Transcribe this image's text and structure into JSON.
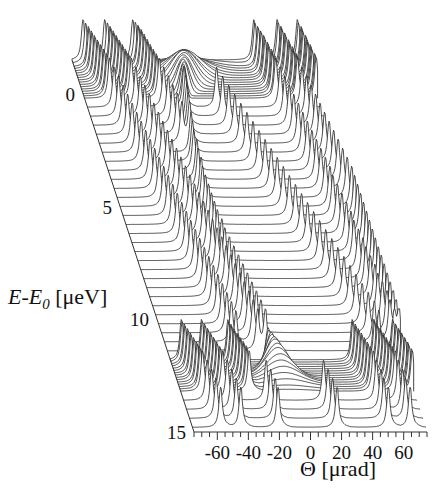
{
  "chart_data": {
    "type": "line",
    "subtype": "waterfall-3d",
    "title": "",
    "xlabel": "Θ [μrad]",
    "ylabel_prefix_italic": "E-E",
    "ylabel_subscript": "0",
    "ylabel_suffix": " [μeV]",
    "xlim": [
      -75,
      75
    ],
    "ylim": [
      -1.5,
      15
    ],
    "x_ticks": [
      -60,
      -40,
      -20,
      0,
      20,
      40,
      60
    ],
    "x_tick_labels": [
      "-60",
      "-40",
      "-20",
      "0",
      "20",
      "40",
      "60"
    ],
    "x_minor_step": 5,
    "y_ticks": [
      0,
      5,
      10,
      15
    ],
    "y_tick_labels": [
      "0",
      "5",
      "10",
      "15"
    ],
    "grid": false,
    "legend": "none",
    "series_model": {
      "description": "Each trace is reflectivity vs Θ at a fixed energy E; sharp peaks at Θ positions listed per trace, plus a broad central bump near resonance energies",
      "dense_energy_bands": [
        [
          -1.5,
          0.2
        ],
        [
          11.8,
          13.2
        ]
      ]
    },
    "traces": [
      {
        "E": -1.5,
        "peaks": [
          -68,
          -54,
          -36,
          42,
          57,
          70
        ],
        "bump": -2,
        "bump_width": 0,
        "bump_height": 0.05
      },
      {
        "E": -1.35,
        "peaks": [
          -67,
          -53,
          -35,
          42,
          57,
          70
        ],
        "bump": -3,
        "bump_width": 16,
        "bump_height": 0.15
      },
      {
        "E": -1.2,
        "peaks": [
          -66,
          -52,
          -34,
          43,
          58,
          71
        ],
        "bump": -4,
        "bump_width": 15,
        "bump_height": 0.25
      },
      {
        "E": -1.1,
        "peaks": [
          -66,
          -52,
          -34,
          43,
          58,
          71
        ],
        "bump": -5,
        "bump_width": 14,
        "bump_height": 0.35
      },
      {
        "E": -1.0,
        "peaks": [
          -65,
          -51,
          -33,
          44,
          58,
          71
        ],
        "bump": -5,
        "bump_width": 13,
        "bump_height": 0.45
      },
      {
        "E": -0.9,
        "peaks": [
          -65,
          -51,
          -33,
          44,
          59,
          71
        ],
        "bump": -6,
        "bump_width": 12,
        "bump_height": 0.55
      },
      {
        "E": -0.8,
        "peaks": [
          -64,
          -50,
          -32,
          45,
          59,
          72
        ],
        "bump": -6,
        "bump_width": 11,
        "bump_height": 0.65
      },
      {
        "E": -0.7,
        "peaks": [
          -64,
          -50,
          -32,
          45,
          59,
          72
        ],
        "bump": -7,
        "bump_width": 10,
        "bump_height": 0.7
      },
      {
        "E": -0.6,
        "peaks": [
          -63,
          -49,
          -31,
          45,
          60,
          72
        ],
        "bump": -7,
        "bump_width": 9,
        "bump_height": 0.75
      },
      {
        "E": -0.5,
        "peaks": [
          -63,
          -49,
          -31,
          46,
          60,
          72
        ],
        "bump": -8,
        "bump_width": 8,
        "bump_height": 0.8
      },
      {
        "E": -0.4,
        "peaks": [
          -62,
          -48,
          -30,
          46,
          60,
          73
        ],
        "bump": -8,
        "bump_width": 7,
        "bump_height": 0.8
      },
      {
        "E": -0.3,
        "peaks": [
          -62,
          -48,
          -30,
          46,
          61,
          73
        ],
        "bump": -9,
        "bump_width": 6,
        "bump_height": 0.8
      },
      {
        "E": -0.2,
        "peaks": [
          -61,
          -47,
          -29,
          47,
          61,
          73
        ],
        "bump": -9,
        "bump_width": 5,
        "bump_height": 0.8
      },
      {
        "E": -0.1,
        "peaks": [
          -61,
          -47,
          -29,
          47,
          61,
          73
        ],
        "bump": -10,
        "bump_width": 4,
        "bump_height": 0.8
      },
      {
        "E": 0.0,
        "peaks": [
          -60,
          -46,
          -28,
          47,
          62,
          74
        ],
        "bump": -10,
        "bump_width": 3,
        "bump_height": 0.8
      },
      {
        "E": 0.1,
        "peaks": [
          -60,
          -46,
          -28,
          48,
          62,
          74
        ],
        "bump": -11,
        "bump_width": 2,
        "bump_height": 0.8
      },
      {
        "E": 0.2,
        "peaks": [
          -59,
          -45,
          -27,
          48,
          62,
          74
        ],
        "bump": -11,
        "bump_width": 1.5,
        "bump_height": 0.8
      },
      {
        "E": 0.6,
        "peaks": [
          -58,
          -44,
          -26,
          -13,
          8,
          49,
          63
        ],
        "bump": 0,
        "bump_width": 0,
        "bump_height": 0
      },
      {
        "E": 1.0,
        "peaks": [
          -57,
          -43,
          -25,
          -14,
          10,
          50,
          64
        ],
        "bump": 0,
        "bump_width": 0,
        "bump_height": 0
      },
      {
        "E": 1.4,
        "peaks": [
          -56,
          -42,
          -24,
          -15,
          12,
          51,
          65
        ],
        "bump": 0,
        "bump_width": 0,
        "bump_height": 0
      },
      {
        "E": 1.8,
        "peaks": [
          -55,
          -41,
          -23,
          -16,
          14,
          52,
          66
        ],
        "bump": 0,
        "bump_width": 0,
        "bump_height": 0
      },
      {
        "E": 2.2,
        "peaks": [
          -54,
          -40,
          -22,
          -17,
          16,
          53,
          67
        ],
        "bump": 0,
        "bump_width": 0,
        "bump_height": 0
      },
      {
        "E": 2.6,
        "peaks": [
          -53,
          -39,
          -18,
          18,
          54,
          68
        ],
        "bump": 0,
        "bump_width": 0,
        "bump_height": 0
      },
      {
        "E": 3.0,
        "peaks": [
          -52,
          -38,
          -19,
          20,
          55,
          69
        ],
        "bump": 0,
        "bump_width": 0,
        "bump_height": 0
      },
      {
        "E": 3.4,
        "peaks": [
          -51,
          -37,
          -20,
          22,
          56,
          70
        ],
        "bump": 0,
        "bump_width": 0,
        "bump_height": 0
      },
      {
        "E": 3.8,
        "peaks": [
          -50,
          -36,
          -20,
          24,
          57,
          71
        ],
        "bump": 0,
        "bump_width": 0,
        "bump_height": 0
      },
      {
        "E": 4.2,
        "peaks": [
          -49,
          -35,
          -21,
          26,
          58,
          72
        ],
        "bump": 0,
        "bump_width": 0,
        "bump_height": 0
      },
      {
        "E": 4.6,
        "peaks": [
          -48,
          -34,
          -21,
          28,
          59,
          73
        ],
        "bump": 0,
        "bump_width": 0,
        "bump_height": 0
      },
      {
        "E": 5.0,
        "peaks": [
          -47,
          -33,
          -22,
          30,
          60,
          74
        ],
        "bump": 0,
        "bump_width": 0,
        "bump_height": 0
      },
      {
        "E": 5.4,
        "peaks": [
          -46,
          -32,
          -22,
          32,
          60,
          74
        ],
        "bump": 0,
        "bump_width": 0,
        "bump_height": 0
      },
      {
        "E": 5.8,
        "peaks": [
          -45,
          -31,
          -22,
          34,
          61,
          74
        ],
        "bump": 0,
        "bump_width": 0,
        "bump_height": 0
      },
      {
        "E": 6.2,
        "peaks": [
          -44,
          -30,
          -22,
          36,
          62,
          74
        ],
        "bump": 0,
        "bump_width": 0,
        "bump_height": 0
      },
      {
        "E": 6.6,
        "peaks": [
          -43,
          -29,
          -22,
          38,
          63,
          74
        ],
        "bump": 0,
        "bump_width": 0,
        "bump_height": 0
      },
      {
        "E": 7.0,
        "peaks": [
          -42,
          -28,
          -22,
          40,
          64,
          74
        ],
        "bump": 0,
        "bump_width": 0,
        "bump_height": 0
      },
      {
        "E": 7.4,
        "peaks": [
          -41,
          -27,
          -21,
          42,
          64,
          74
        ],
        "bump": 0,
        "bump_width": 0,
        "bump_height": 0
      },
      {
        "E": 7.8,
        "peaks": [
          -40,
          -26,
          -21,
          44,
          65,
          74
        ],
        "bump": 0,
        "bump_width": 0,
        "bump_height": 0
      },
      {
        "E": 8.2,
        "peaks": [
          -39,
          -25,
          -20,
          46,
          66,
          74
        ],
        "bump": 0,
        "bump_width": 0,
        "bump_height": 0
      },
      {
        "E": 8.6,
        "peaks": [
          -38,
          -24,
          -19,
          48,
          66,
          74
        ],
        "bump": 0,
        "bump_width": 0,
        "bump_height": 0
      },
      {
        "E": 9.0,
        "peaks": [
          -37,
          -23,
          -18,
          50,
          67,
          74
        ],
        "bump": 0,
        "bump_width": 0,
        "bump_height": 0
      },
      {
        "E": 9.4,
        "peaks": [
          -36,
          -22,
          -17,
          52,
          68,
          74
        ],
        "bump": 0,
        "bump_width": 0,
        "bump_height": 0
      },
      {
        "E": 9.8,
        "peaks": [
          -35,
          -21,
          -16,
          54,
          68,
          74
        ],
        "bump": 0,
        "bump_width": 0,
        "bump_height": 0
      },
      {
        "E": 10.2,
        "peaks": [
          -34,
          -20,
          -15,
          56,
          69,
          74
        ],
        "bump": 0,
        "bump_width": 0,
        "bump_height": 0
      },
      {
        "E": 10.6,
        "peaks": [
          -33,
          -19,
          -14,
          58,
          70,
          74
        ],
        "bump": 0,
        "bump_width": 0,
        "bump_height": 0
      },
      {
        "E": 11.0,
        "peaks": [
          -32,
          -18,
          -13,
          60,
          70,
          74
        ],
        "bump": 0,
        "bump_width": 0,
        "bump_height": 0
      },
      {
        "E": 11.4,
        "peaks": [
          -31,
          -17,
          -12,
          61,
          71,
          74
        ],
        "bump": 0,
        "bump_width": 0,
        "bump_height": 0
      },
      {
        "E": 11.8,
        "peaks": [
          -68,
          -55,
          -38,
          42,
          56,
          68
        ],
        "bump": -12,
        "bump_width": 1.5,
        "bump_height": 0.8
      },
      {
        "E": 11.9,
        "peaks": [
          -68,
          -55,
          -38,
          42,
          56,
          68
        ],
        "bump": -12,
        "bump_width": 2,
        "bump_height": 0.8
      },
      {
        "E": 12.0,
        "peaks": [
          -67,
          -54,
          -37,
          43,
          57,
          69
        ],
        "bump": -11,
        "bump_width": 3,
        "bump_height": 0.8
      },
      {
        "E": 12.1,
        "peaks": [
          -67,
          -54,
          -37,
          43,
          57,
          69
        ],
        "bump": -11,
        "bump_width": 4,
        "bump_height": 0.8
      },
      {
        "E": 12.2,
        "peaks": [
          -66,
          -53,
          -36,
          44,
          58,
          70
        ],
        "bump": -10,
        "bump_width": 5,
        "bump_height": 0.8
      },
      {
        "E": 12.3,
        "peaks": [
          -66,
          -53,
          -36,
          44,
          58,
          70
        ],
        "bump": -10,
        "bump_width": 6,
        "bump_height": 0.8
      },
      {
        "E": 12.4,
        "peaks": [
          -65,
          -52,
          -35,
          45,
          59,
          71
        ],
        "bump": -9,
        "bump_width": 7,
        "bump_height": 0.75
      },
      {
        "E": 12.5,
        "peaks": [
          -65,
          -52,
          -35,
          45,
          59,
          71
        ],
        "bump": -9,
        "bump_width": 8,
        "bump_height": 0.7
      },
      {
        "E": 12.6,
        "peaks": [
          -64,
          -51,
          -34,
          46,
          60,
          72
        ],
        "bump": -8,
        "bump_width": 9,
        "bump_height": 0.6
      },
      {
        "E": 12.7,
        "peaks": [
          -64,
          -51,
          -34,
          46,
          60,
          72
        ],
        "bump": -8,
        "bump_width": 10,
        "bump_height": 0.5
      },
      {
        "E": 12.8,
        "peaks": [
          -63,
          -50,
          -33,
          47,
          61,
          73
        ],
        "bump": -7,
        "bump_width": 11,
        "bump_height": 0.4
      },
      {
        "E": 12.9,
        "peaks": [
          -63,
          -50,
          -33,
          47,
          61,
          73
        ],
        "bump": -7,
        "bump_width": 12,
        "bump_height": 0.3
      },
      {
        "E": 13.0,
        "peaks": [
          -62,
          -49,
          -32,
          48,
          62,
          73
        ],
        "bump": -6,
        "bump_width": 13,
        "bump_height": 0.2
      },
      {
        "E": 13.1,
        "peaks": [
          -62,
          -49,
          -32,
          48,
          62,
          74
        ],
        "bump": -6,
        "bump_width": 14,
        "bump_height": 0.1
      },
      {
        "E": 13.2,
        "peaks": [
          -61,
          -48,
          -31,
          49,
          63,
          74
        ],
        "bump": -5,
        "bump_width": 15,
        "bump_height": 0.05
      },
      {
        "E": 13.6,
        "peaks": [
          -60,
          -47,
          -22,
          15,
          49,
          63
        ],
        "bump": 0,
        "bump_width": 0,
        "bump_height": 0
      },
      {
        "E": 14.0,
        "peaks": [
          -59,
          -46,
          -21,
          16,
          50,
          64
        ],
        "bump": 0,
        "bump_width": 0,
        "bump_height": 0
      },
      {
        "E": 14.4,
        "peaks": [
          -58,
          -45,
          -20,
          17,
          50,
          64
        ],
        "bump": 0,
        "bump_width": 0,
        "bump_height": 0
      },
      {
        "E": 14.8,
        "peaks": [
          -57,
          -44,
          -20,
          18,
          51,
          65
        ],
        "bump": 0,
        "bump_width": 0,
        "bump_height": 0
      }
    ]
  }
}
